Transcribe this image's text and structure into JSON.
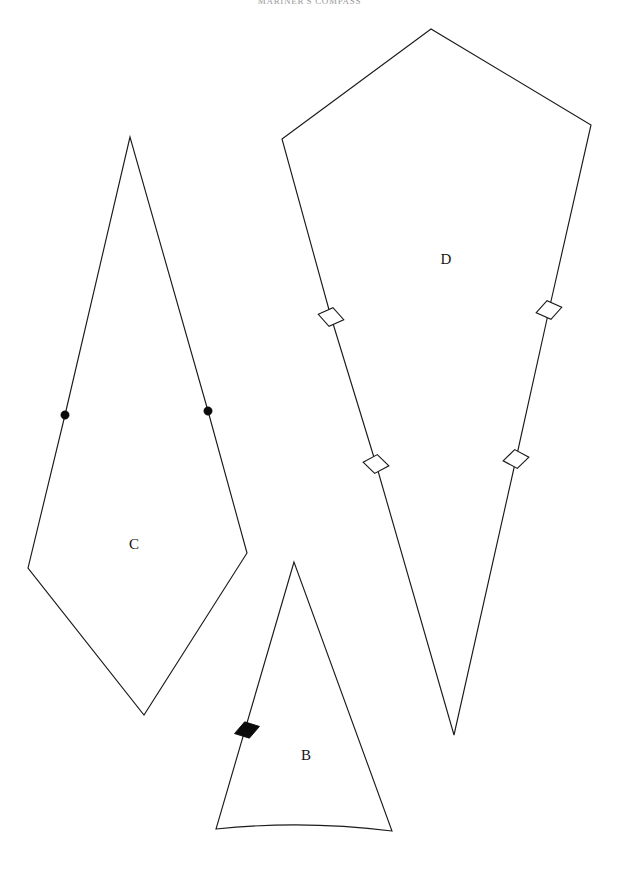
{
  "page": {
    "width": 619,
    "height": 869,
    "background_color": "#ffffff",
    "ink_color": "#1b1b1b",
    "document_type": "quilt pattern template sheet"
  },
  "header": {
    "title": "MARINER'S COMPASS",
    "color": "#9a9a9a",
    "clipped_at_top": true
  },
  "pieces": [
    {
      "id": "piece-c",
      "label": "C",
      "label_x": 134,
      "label_y": 546,
      "shape": "elongated kite hexagon",
      "points": "130,137 65,415 28,568 144,715 247,553 208,411",
      "markers": [
        {
          "kind": "dot",
          "cx": 65,
          "cy": 415,
          "r": 4.2
        },
        {
          "kind": "dot",
          "cx": 208,
          "cy": 411,
          "r": 4.2
        }
      ]
    },
    {
      "id": "piece-b",
      "label": "B",
      "label_x": 306,
      "label_y": 757,
      "shape": "narrow wedge with curved base",
      "path": "M 294 562 L 216 829 Q 304 820 392 831 Z",
      "markers": [
        {
          "kind": "diamond-filled",
          "cx": 247,
          "cy": 730,
          "rx": 13,
          "ry": 8.5,
          "rotate": -16
        }
      ]
    },
    {
      "id": "piece-d",
      "label": "D",
      "label_x": 446,
      "label_y": 261,
      "shape": "large pentagon kite",
      "points": "431,29 282,139 331,317 376,464 454,735 516,459 549,310 591,125",
      "markers": [
        {
          "kind": "diamond-open",
          "cx": 331,
          "cy": 317,
          "rx": 13,
          "ry": 9.5,
          "rotate": 12
        },
        {
          "kind": "diamond-open",
          "cx": 376,
          "cy": 464,
          "rx": 13,
          "ry": 9.5,
          "rotate": 8
        },
        {
          "kind": "diamond-open",
          "cx": 549,
          "cy": 310,
          "rx": 13,
          "ry": 9.5,
          "rotate": -12
        },
        {
          "kind": "diamond-open",
          "cx": 516,
          "cy": 459,
          "rx": 13,
          "ry": 9.5,
          "rotate": -8
        }
      ]
    }
  ]
}
